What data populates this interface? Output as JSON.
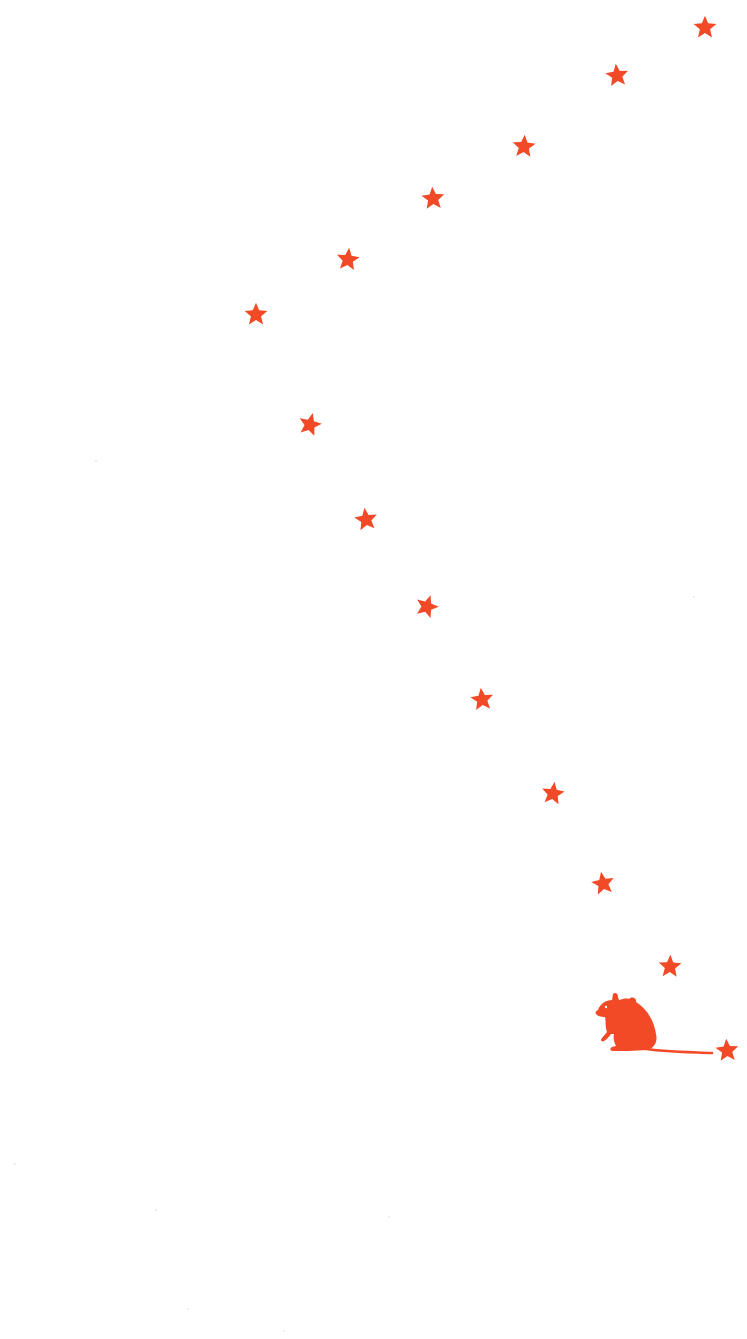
{
  "illustration": {
    "description": "Mouse silhouette following a curving trail of stars",
    "background": "#ffffff",
    "accent_color": "#f24a26",
    "stars": [
      {
        "x": 705,
        "y": 27,
        "rotate": 0
      },
      {
        "x": 617,
        "y": 75,
        "rotate": -6
      },
      {
        "x": 524,
        "y": 146,
        "rotate": 4
      },
      {
        "x": 433,
        "y": 198,
        "rotate": -4
      },
      {
        "x": 348,
        "y": 259,
        "rotate": 6
      },
      {
        "x": 256,
        "y": 314,
        "rotate": 0
      },
      {
        "x": 310,
        "y": 424,
        "rotate": 14
      },
      {
        "x": 366,
        "y": 519,
        "rotate": -8
      },
      {
        "x": 427,
        "y": 606,
        "rotate": 18
      },
      {
        "x": 482,
        "y": 699,
        "rotate": -6
      },
      {
        "x": 553,
        "y": 793,
        "rotate": 8
      },
      {
        "x": 603,
        "y": 883,
        "rotate": -10
      },
      {
        "x": 670,
        "y": 966,
        "rotate": 2
      },
      {
        "x": 727,
        "y": 1050,
        "rotate": -4
      }
    ],
    "mouse": {
      "x": 592,
      "y": 990,
      "icon": "mouse-silhouette"
    },
    "specks": [
      {
        "x": 95,
        "y": 460
      },
      {
        "x": 693,
        "y": 596
      },
      {
        "x": 14,
        "y": 1163
      },
      {
        "x": 155,
        "y": 1209
      },
      {
        "x": 388,
        "y": 1216
      },
      {
        "x": 187,
        "y": 1308
      },
      {
        "x": 283,
        "y": 1330
      }
    ]
  }
}
